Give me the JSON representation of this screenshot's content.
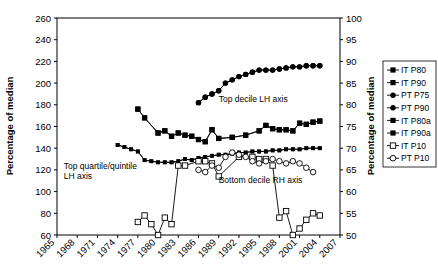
{
  "chart_data": {
    "type": "line",
    "title": "",
    "xlabel": "",
    "ylabel": "Percentage of median",
    "ylabel_right": "Percentage of median",
    "xlim": [
      1965,
      2007
    ],
    "ylim": [
      60,
      260
    ],
    "ylim_right": [
      50,
      100
    ],
    "grid": false,
    "legend_position": "right",
    "x_ticks": [
      1965,
      1968,
      1971,
      1974,
      1977,
      1980,
      1983,
      1986,
      1989,
      1992,
      1995,
      1998,
      2001,
      2004,
      2007
    ],
    "y_ticks_left": [
      60,
      80,
      100,
      120,
      140,
      160,
      180,
      200,
      220,
      240,
      260
    ],
    "y_ticks_right": [
      50,
      55,
      60,
      65,
      70,
      75,
      80,
      85,
      90,
      95,
      100
    ],
    "annotations": [
      {
        "text": "Top decile LH axis",
        "x": 1989,
        "y": 183
      },
      {
        "text": "Top quartile/quintile LH axis",
        "x": 1966,
        "y": 121
      },
      {
        "text": "Bottom decile RH axis",
        "x": 1989,
        "y": 108
      }
    ],
    "series": [
      {
        "name": "IT P80",
        "marker": "square-filled",
        "axis": "left",
        "x": [
          1977,
          1978,
          1980,
          1981,
          1982,
          1983,
          1984,
          1985,
          1986,
          1987,
          1988,
          1989,
          1991,
          1993,
          1995,
          1996,
          1997,
          1998,
          1999,
          2000,
          2001,
          2002,
          2003,
          2004
        ],
        "y": [
          176,
          168,
          154,
          156,
          151,
          154,
          152,
          151,
          148,
          146,
          157,
          149,
          150,
          152,
          156,
          161,
          158,
          157,
          157,
          156,
          163,
          162,
          164,
          165
        ]
      },
      {
        "name": "IT P90",
        "marker": "square-filled",
        "axis": "left",
        "x": [
          1977,
          1978,
          1980,
          1981,
          1982,
          1983,
          1984,
          1985,
          1986,
          1987,
          1988,
          1989,
          1991,
          1993,
          1995,
          1996,
          1997,
          1998,
          1999,
          2000,
          2001,
          2002,
          2003,
          2004
        ],
        "y": [
          176,
          168,
          154,
          156,
          151,
          154,
          152,
          151,
          148,
          146,
          157,
          149,
          150,
          152,
          156,
          161,
          158,
          157,
          157,
          156,
          163,
          162,
          164,
          165
        ]
      },
      {
        "name": "PT P75",
        "marker": "circle-filled",
        "axis": "left",
        "x": [
          1986,
          1987,
          1988,
          1989,
          1990,
          1991,
          1992,
          1993,
          1994,
          1995,
          1996,
          1997,
          1998,
          1999,
          2000,
          2001,
          2002,
          2003,
          2004
        ],
        "y": [
          182,
          187,
          190,
          193,
          200,
          203,
          206,
          208,
          210,
          212,
          212,
          212,
          213,
          214,
          215,
          215,
          216,
          216,
          216
        ]
      },
      {
        "name": "PT P90",
        "marker": "circle-filled",
        "axis": "left",
        "x": [
          1986,
          1987,
          1988,
          1989,
          1990,
          1991,
          1992,
          1993,
          1994,
          1995,
          1996,
          1997,
          1998,
          1999,
          2000,
          2001,
          2002,
          2003,
          2004
        ],
        "y": [
          182,
          187,
          190,
          193,
          200,
          203,
          206,
          208,
          210,
          212,
          212,
          212,
          213,
          214,
          215,
          215,
          216,
          216,
          216
        ]
      },
      {
        "name": "IT P80a",
        "marker": "square-filled-small",
        "axis": "left",
        "x": [
          1974,
          1975,
          1976,
          1977,
          1978,
          1979,
          1980,
          1981,
          1982,
          1983,
          1984,
          1985,
          1986,
          1987,
          1988,
          1989,
          1990,
          1991,
          1992,
          1993,
          1994,
          1995,
          1996,
          1997,
          1998,
          1999,
          2000,
          2001,
          2002,
          2003,
          2004
        ],
        "y": [
          143,
          141,
          139,
          137,
          129,
          128,
          127,
          127,
          127,
          128,
          130,
          129,
          131,
          132,
          133,
          134,
          134,
          135,
          136,
          136,
          137,
          137,
          137,
          138,
          138,
          139,
          139,
          139,
          140,
          140,
          140
        ]
      },
      {
        "name": "IT P90a",
        "marker": "square-filled-small",
        "axis": "left",
        "x": [
          1974,
          1975,
          1976,
          1977,
          1978,
          1979,
          1980,
          1981,
          1982,
          1983,
          1984,
          1985,
          1986,
          1987,
          1988,
          1989,
          1990,
          1991,
          1992,
          1993,
          1994,
          1995,
          1996,
          1997,
          1998,
          1999,
          2000,
          2001,
          2002,
          2003,
          2004
        ],
        "y": [
          143,
          141,
          139,
          137,
          129,
          128,
          127,
          127,
          127,
          128,
          130,
          129,
          131,
          132,
          133,
          134,
          134,
          135,
          136,
          136,
          137,
          137,
          137,
          138,
          138,
          139,
          139,
          139,
          140,
          140,
          140
        ]
      },
      {
        "name": "IT P10",
        "marker": "square-open",
        "axis": "right",
        "x": [
          1977,
          1978,
          1979,
          1980,
          1981,
          1982,
          1983,
          1984,
          1986,
          1987,
          1988,
          1989,
          1992,
          1994,
          1995,
          1996,
          1997,
          1998,
          1999,
          2000,
          2001,
          2002,
          2003,
          2004
        ],
        "y": [
          53,
          54.5,
          52.5,
          50,
          54,
          52.5,
          66,
          66,
          67,
          67,
          66.5,
          63.5,
          68,
          68,
          67.5,
          67.5,
          66,
          54,
          55.5,
          50,
          51.5,
          53.5,
          55,
          54.5
        ]
      },
      {
        "name": "PT P10",
        "marker": "circle-open",
        "axis": "right",
        "x": [
          1986,
          1987,
          1988,
          1989,
          1990,
          1991,
          1992,
          1993,
          1994,
          1995,
          1996,
          1997,
          1998,
          1999,
          2000,
          2001,
          2002,
          2003
        ],
        "y": [
          65,
          64.5,
          66,
          65.5,
          68,
          69,
          68.5,
          68,
          67,
          66.5,
          67,
          67.5,
          67,
          66.5,
          67,
          66.5,
          65.5,
          64.5
        ]
      }
    ],
    "legend": [
      {
        "label": "IT P80",
        "marker": "square-filled"
      },
      {
        "label": "IT P90",
        "marker": "square-filled"
      },
      {
        "label": "PT P75",
        "marker": "circle-filled"
      },
      {
        "label": "PT P90",
        "marker": "circle-filled"
      },
      {
        "label": "IT P80a",
        "marker": "square-filled"
      },
      {
        "label": "IT P90a",
        "marker": "square-filled"
      },
      {
        "label": "IT P10",
        "marker": "square-open"
      },
      {
        "label": "PT P10",
        "marker": "circle-open"
      }
    ]
  }
}
